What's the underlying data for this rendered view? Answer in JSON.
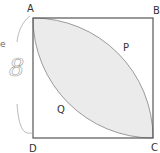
{
  "diagram": {
    "labels": {
      "A": "A",
      "B": "B",
      "C": "C",
      "D": "D",
      "P": "P",
      "Q": "Q"
    },
    "handwritten_annotation": "8",
    "colors": {
      "square_stroke": "#555555",
      "arc_stroke": "#999999",
      "shaded_fill": "#ebebeb",
      "pencil": "#9a9a9a"
    }
  }
}
